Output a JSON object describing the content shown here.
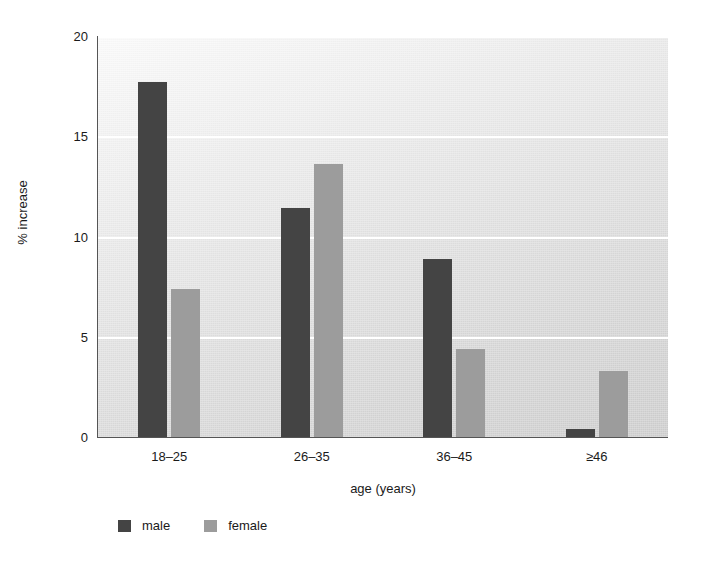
{
  "chart_data": {
    "type": "bar",
    "title": "",
    "subtitle": "",
    "xlabel": "age (years)",
    "ylabel": "% increase",
    "categories": [
      "18–25",
      "26–35",
      "36–45",
      "≥46"
    ],
    "series": [
      {
        "name": "male",
        "color": "#444444",
        "values": [
          17.7,
          11.4,
          8.9,
          0.4
        ]
      },
      {
        "name": "female",
        "color": "#9c9c9c",
        "values": [
          7.4,
          13.6,
          4.4,
          3.3
        ]
      }
    ],
    "ylim": [
      0,
      20
    ],
    "yticks": [
      0,
      5,
      10,
      15,
      20
    ],
    "ytick_labels": [
      "0",
      "5",
      "10",
      "15",
      "20"
    ],
    "grid": "horizontal-only",
    "gridline_color": "#ffffff",
    "legend_position": "bottom-left",
    "plot_background": "light-gray-gradient"
  },
  "legend": {
    "items": [
      {
        "label": "male",
        "swatch": "male"
      },
      {
        "label": "female",
        "swatch": "female"
      }
    ]
  },
  "axes": {
    "y_title": "% increase",
    "x_title": "age (years)"
  }
}
